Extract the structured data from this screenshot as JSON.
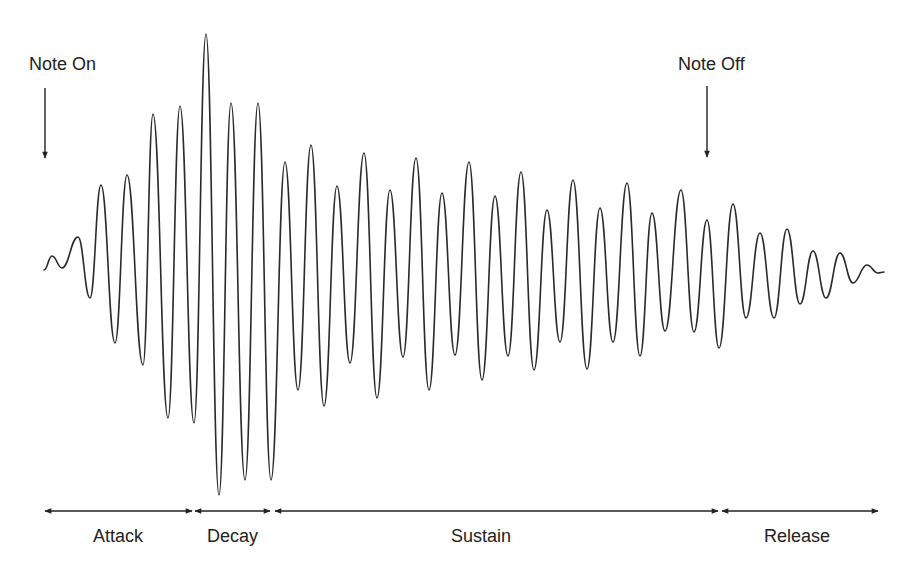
{
  "markers": {
    "note_on": {
      "label": "Note On",
      "x": 45
    },
    "note_off": {
      "label": "Note Off",
      "x": 707
    }
  },
  "phases": [
    {
      "label": "Attack",
      "x_start": 45,
      "x_end": 192
    },
    {
      "label": "Decay",
      "x_start": 195,
      "x_end": 270
    },
    {
      "label": "Sustain",
      "x_start": 275,
      "x_end": 718
    },
    {
      "label": "Release",
      "x_start": 722,
      "x_end": 878
    }
  ],
  "colors": {
    "line": "#222222",
    "background": "#ffffff"
  },
  "waveform": {
    "baseline_y": 270,
    "start_x": 44,
    "end_x": 884,
    "peaks": [
      [
        52,
        256,
        "p"
      ],
      [
        62,
        268,
        "m"
      ],
      [
        78,
        237,
        "p"
      ],
      [
        90,
        298,
        "t"
      ],
      [
        101,
        185,
        "p"
      ],
      [
        115,
        343,
        "t"
      ],
      [
        127,
        175,
        "p"
      ],
      [
        143,
        365,
        "t"
      ],
      [
        153,
        114,
        "p"
      ],
      [
        168,
        418,
        "t"
      ],
      [
        180,
        106,
        "p"
      ],
      [
        194,
        423,
        "t"
      ],
      [
        206,
        34,
        "p"
      ],
      [
        219,
        495,
        "t"
      ],
      [
        231,
        103,
        "p"
      ],
      [
        245,
        480,
        "t"
      ],
      [
        258,
        103,
        "p"
      ],
      [
        271,
        480,
        "t"
      ],
      [
        285,
        162,
        "p"
      ],
      [
        298,
        390,
        "t"
      ],
      [
        311,
        145,
        "p"
      ],
      [
        324,
        406,
        "t"
      ],
      [
        337,
        186,
        "p"
      ],
      [
        350,
        363,
        "t"
      ],
      [
        364,
        153,
        "p"
      ],
      [
        377,
        398,
        "t"
      ],
      [
        390,
        190,
        "p"
      ],
      [
        403,
        357,
        "t"
      ],
      [
        416,
        158,
        "p"
      ],
      [
        429,
        390,
        "t"
      ],
      [
        442,
        193,
        "p"
      ],
      [
        455,
        355,
        "t"
      ],
      [
        469,
        162,
        "p"
      ],
      [
        482,
        380,
        "t"
      ],
      [
        495,
        196,
        "p"
      ],
      [
        508,
        356,
        "t"
      ],
      [
        521,
        172,
        "p"
      ],
      [
        534,
        370,
        "t"
      ],
      [
        547,
        210,
        "p"
      ],
      [
        560,
        342,
        "t"
      ],
      [
        573,
        180,
        "p"
      ],
      [
        587,
        369,
        "t"
      ],
      [
        600,
        208,
        "p"
      ],
      [
        613,
        342,
        "t"
      ],
      [
        627,
        183,
        "p"
      ],
      [
        640,
        356,
        "t"
      ],
      [
        652,
        213,
        "p"
      ],
      [
        665,
        331,
        "t"
      ],
      [
        681,
        190,
        "p"
      ],
      [
        694,
        332,
        "t"
      ],
      [
        707,
        220,
        "p"
      ],
      [
        719,
        348,
        "t"
      ],
      [
        733,
        204,
        "p"
      ],
      [
        746,
        318,
        "t"
      ],
      [
        760,
        233,
        "p"
      ],
      [
        774,
        318,
        "t"
      ],
      [
        787,
        229,
        "p"
      ],
      [
        800,
        304,
        "t"
      ],
      [
        813,
        251,
        "p"
      ],
      [
        826,
        298,
        "t"
      ],
      [
        840,
        253,
        "p"
      ],
      [
        853,
        283,
        "t"
      ],
      [
        867,
        265,
        "p"
      ],
      [
        878,
        273,
        "t"
      ],
      [
        884,
        272,
        "m"
      ]
    ]
  }
}
